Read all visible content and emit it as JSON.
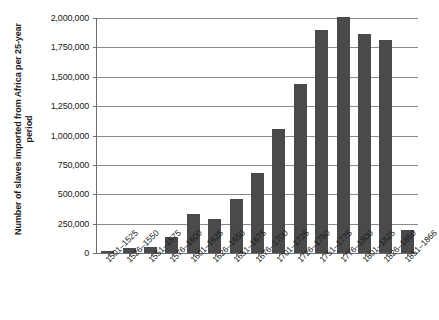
{
  "figure": {
    "caption_strip": "",
    "bar_color": "#4a4a4a",
    "gridline_color": "#8a8a8a",
    "axis_color": "#6e6e6e"
  },
  "chart_data": {
    "type": "bar",
    "title": "",
    "xlabel": "",
    "ylabel": "Number of slaves imported from Africa per 25-year period",
    "ylim": [
      0,
      2000000
    ],
    "ytick_values": [
      0,
      250000,
      500000,
      750000,
      1000000,
      1250000,
      1500000,
      1750000,
      2000000
    ],
    "ytick_labels": [
      "0",
      "250,000",
      "500,000",
      "750,000",
      "1,000,000",
      "1,250,000",
      "1,500,000",
      "1,750,000",
      "2,000,000"
    ],
    "grid": true,
    "grid_axis": "y",
    "legend": false,
    "legend_position": "none",
    "categories": [
      "1501–1525",
      "1526–1550",
      "1551–1575",
      "1576–1600",
      "1601–1625",
      "1626–1650",
      "1651–1675",
      "1676–1700",
      "1701–1725",
      "1726–1750",
      "1751–1775",
      "1776–1800",
      "1801–1825",
      "1826–1850",
      "1851–1866"
    ],
    "values": [
      20000,
      45000,
      55000,
      135000,
      330000,
      290000,
      460000,
      685000,
      1055000,
      1440000,
      1900000,
      2010000,
      1865000,
      1815000,
      195000
    ]
  }
}
